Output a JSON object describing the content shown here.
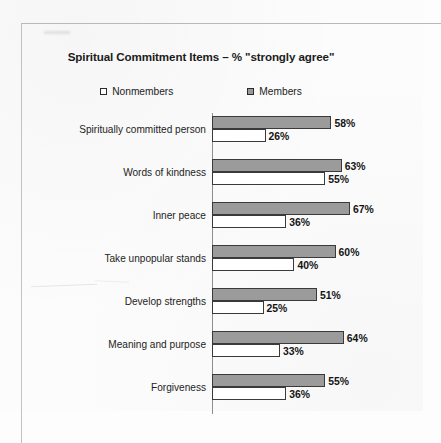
{
  "chart_data": {
    "type": "bar",
    "orientation": "horizontal",
    "title": "Spiritual Commitment Items – % \"strongly agree\"",
    "xlabel": "",
    "ylabel": "",
    "xlim": [
      0,
      70
    ],
    "grid": false,
    "legend_position": "top-center",
    "categories": [
      "Spiritually committed person",
      "Words of kindness",
      "Inner peace",
      "Take unpopular stands",
      "Develop strengths",
      "Meaning and purpose",
      "Forgiveness"
    ],
    "series": [
      {
        "name": "Members",
        "color": "#9b9b9b",
        "values": [
          58,
          63,
          67,
          60,
          51,
          64,
          55
        ],
        "value_labels": [
          "58%",
          "63%",
          "67%",
          "60%",
          "51%",
          "64%",
          "55%"
        ]
      },
      {
        "name": "Nonmembers",
        "color": "#ffffff",
        "values": [
          26,
          55,
          36,
          40,
          25,
          33,
          36
        ],
        "value_labels": [
          "26%",
          "55%",
          "36%",
          "40%",
          "25%",
          "33%",
          "36%"
        ]
      }
    ]
  },
  "legend": {
    "items": [
      {
        "label": "Nonmembers",
        "swatch": "hollow-square-icon"
      },
      {
        "label": "Members",
        "swatch": "filled-square-icon"
      }
    ]
  },
  "colors": {
    "members_bar": "#9b9b9b",
    "nonmembers_bar": "#ffffff",
    "bar_outline": "#3a3a3a",
    "text": "#1d1d1d",
    "frame": "#b9b9b9"
  }
}
